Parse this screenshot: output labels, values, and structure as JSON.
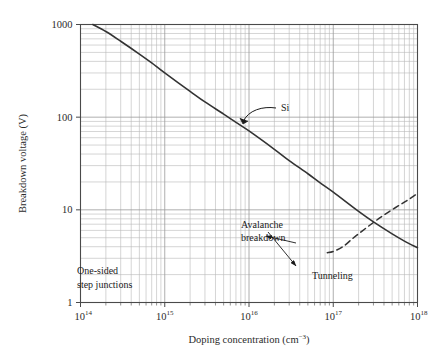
{
  "chart_data": {
    "type": "line",
    "title": "",
    "xlabel": "Doping concentration (cm⁻³)",
    "ylabel": "Breakdown voltage (V)",
    "xscale": "log",
    "yscale": "log",
    "xlim": [
      100000000000000.0,
      1e+18
    ],
    "ylim": [
      1,
      1000
    ],
    "grid": true,
    "minor_grid": true,
    "legend_position": "none",
    "xticks": [
      {
        "value": 100000000000000.0,
        "mantissa": "10",
        "exponent": "14"
      },
      {
        "value": 1000000000000000.0,
        "mantissa": "10",
        "exponent": "15"
      },
      {
        "value": 1e+16,
        "mantissa": "10",
        "exponent": "16"
      },
      {
        "value": 1e+17,
        "mantissa": "10",
        "exponent": "17"
      },
      {
        "value": 1e+18,
        "mantissa": "10",
        "exponent": "18"
      }
    ],
    "yticks": [
      {
        "value": 1000,
        "label": "1000"
      },
      {
        "value": 100,
        "label": "100"
      },
      {
        "value": 10,
        "label": "10"
      },
      {
        "value": 1,
        "label": "1"
      }
    ],
    "series": [
      {
        "name": "Si",
        "style": "solid",
        "color": "#333333",
        "points": [
          [
            140000000000000.0,
            1000
          ],
          [
            200000000000000.0,
            840
          ],
          [
            300000000000000.0,
            660
          ],
          [
            500000000000000.0,
            480
          ],
          [
            700000000000000.0,
            385
          ],
          [
            1000000000000000.0,
            300
          ],
          [
            2000000000000000.0,
            190
          ],
          [
            3000000000000000.0,
            146
          ],
          [
            5000000000000000.0,
            108
          ],
          [
            7000000000000000.0,
            88
          ],
          [
            1e+16,
            71
          ],
          [
            2e+16,
            45
          ],
          [
            3e+16,
            34
          ],
          [
            5e+16,
            24.5
          ],
          [
            7e+16,
            19.5
          ],
          [
            1e+17,
            15.5
          ],
          [
            2e+17,
            9.6
          ],
          [
            3e+17,
            7.4
          ],
          [
            5e+17,
            5.5
          ],
          [
            7e+17,
            4.6
          ],
          [
            1e+18,
            3.9
          ]
        ]
      },
      {
        "name": "Tunneling",
        "style": "dashed",
        "color": "#333333",
        "points": [
          [
            8.5e+16,
            3.45
          ],
          [
            1e+17,
            3.55
          ],
          [
            1.3e+17,
            4.0
          ],
          [
            1.7e+17,
            4.9
          ],
          [
            2.2e+17,
            5.9
          ],
          [
            3e+17,
            7.3
          ],
          [
            4e+17,
            8.8
          ],
          [
            5.5e+17,
            10.6
          ],
          [
            7.5e+17,
            12.6
          ],
          [
            1e+18,
            15.0
          ]
        ]
      }
    ],
    "annotations": [
      {
        "name": "si-label",
        "text": "Si",
        "x_px": 281,
        "y_px": 111,
        "leader": "curve-to-upper-right"
      },
      {
        "name": "avalanche-label",
        "text_line1": "Avalanche",
        "text_line2": "breakdown",
        "x_px": 241,
        "y_px": 228,
        "arrow_to": "solid-curve"
      },
      {
        "name": "tunneling-label",
        "text": "Tunneling",
        "x_px": 312,
        "y_px": 279,
        "arrow_to": "dashed-curve"
      },
      {
        "name": "one-sided-label",
        "text_line1": "One-sided",
        "text_line2": "step junctions",
        "x_px": 77,
        "y_px": 274
      }
    ]
  },
  "figure": {
    "background": "#ffffff",
    "axis_color": "#4a4a4a",
    "grid_major_color": "#9a9a9a",
    "grid_minor_color": "#b8b8b8",
    "curve_color": "#333333"
  }
}
